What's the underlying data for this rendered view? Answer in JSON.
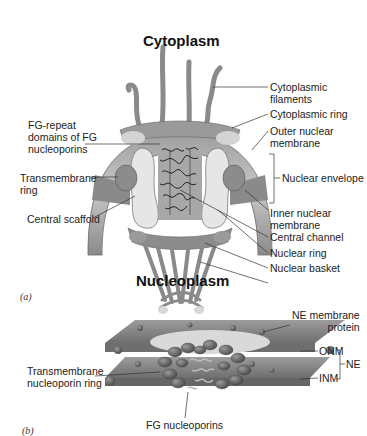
{
  "panel_a": {
    "panel_label": "(a)",
    "title_top": "Cytoplasm",
    "title_bottom": "Nucleoplasm",
    "labels": {
      "fg_repeat": [
        "FG-repeat",
        "domains of FG",
        "nucleoporins"
      ],
      "transmembrane_ring": [
        "Transmembrane",
        "ring"
      ],
      "central_scaffold": "Central scaffold",
      "cytoplasmic_filaments": [
        "Cytoplasmic",
        "filaments"
      ],
      "cytoplasmic_ring": "Cytoplasmic ring",
      "outer_nuclear_membrane": [
        "Outer nuclear",
        "membrane"
      ],
      "nuclear_envelope": "Nuclear envelope",
      "inner_nuclear_membrane": [
        "Inner nuclear",
        "membrane"
      ],
      "central_channel": "Central channel",
      "nuclear_ring": "Nuclear ring",
      "nuclear_basket": "Nuclear basket"
    }
  },
  "panel_b": {
    "panel_label": "(b)",
    "labels": {
      "ne_membrane_protein": [
        "NE membrane",
        "protein"
      ],
      "onm": "ONM",
      "inm": "INM",
      "ne": "NE",
      "transmembrane_nucleoporin_ring": [
        "Transmembrane",
        "nucleoporin ring"
      ],
      "fg_nucleoporins": "FG nucleoporins"
    }
  },
  "colors": {
    "membrane_dark": "#7a7a7a",
    "membrane_light": "#b5b5b5",
    "scaffold_light": "#e4e4e4",
    "line": "#333333"
  }
}
